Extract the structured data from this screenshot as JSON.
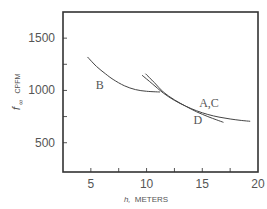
{
  "chart_data": {
    "type": "line",
    "title": "",
    "xlabel": "h, METERS",
    "xlabel_parts": {
      "var": "h,",
      "unit": "METERS"
    },
    "ylabel": "f∞ CPFM",
    "ylabel_parts": {
      "var": "f",
      "sub": "∞",
      "unit": "CPFM"
    },
    "xlim": [
      2.5,
      20
    ],
    "ylim": [
      220,
      1750
    ],
    "xticks": [
      2.5,
      5,
      7.5,
      10,
      12.5,
      15,
      17.5,
      20
    ],
    "xtick_labels": [
      {
        "value": 5,
        "label": "5"
      },
      {
        "value": 10,
        "label": "10"
      },
      {
        "value": 15,
        "label": "15"
      },
      {
        "value": 20,
        "label": "20"
      }
    ],
    "yticks": [
      500,
      750,
      1000,
      1250,
      1500
    ],
    "ytick_labels": [
      {
        "value": 500,
        "label": "500"
      },
      {
        "value": 1000,
        "label": "1000"
      },
      {
        "value": 1500,
        "label": "1500"
      }
    ],
    "grid": false,
    "legend": "none (curves labeled inline)",
    "series": [
      {
        "name": "B",
        "label": "B",
        "label_at": {
          "x": 5.8,
          "y": 1010
        },
        "points": [
          [
            4.7,
            1320
          ],
          [
            5.5,
            1230
          ],
          [
            6.3,
            1160
          ],
          [
            7,
            1105
          ],
          [
            8,
            1045
          ],
          [
            9,
            1008
          ],
          [
            10,
            992
          ],
          [
            11.2,
            985
          ]
        ]
      },
      {
        "name": "A,C",
        "label": "A,C",
        "label_at": {
          "x": 15.6,
          "y": 845
        },
        "points": [
          [
            9.6,
            1145
          ],
          [
            10.5,
            1065
          ],
          [
            11.5,
            975
          ],
          [
            12.5,
            905
          ],
          [
            13.5,
            850
          ],
          [
            14.5,
            805
          ],
          [
            15.5,
            770
          ],
          [
            16.5,
            745
          ],
          [
            17.5,
            727
          ],
          [
            18.5,
            713
          ],
          [
            19.3,
            705
          ]
        ]
      },
      {
        "name": "D",
        "label": "D",
        "label_at": {
          "x": 14.6,
          "y": 680
        },
        "points": [
          [
            9.9,
            1160
          ],
          [
            10.7,
            1075
          ],
          [
            11.5,
            985
          ],
          [
            12.5,
            910
          ],
          [
            13.5,
            850
          ],
          [
            14.5,
            795
          ],
          [
            15.5,
            750
          ],
          [
            16.3,
            718
          ],
          [
            16.9,
            695
          ]
        ]
      }
    ]
  }
}
